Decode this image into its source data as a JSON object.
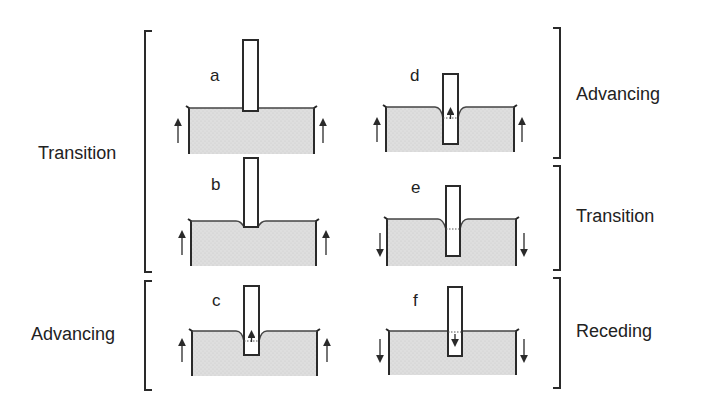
{
  "figure": {
    "colors": {
      "liquid_fill": "#dcdcdc",
      "stroke": "#2a2a2a",
      "background": "#ffffff"
    },
    "left_groups": [
      {
        "label": "Transition",
        "panels": [
          "a",
          "b"
        ]
      },
      {
        "label": "Advancing",
        "panels": [
          "c"
        ]
      }
    ],
    "right_groups": [
      {
        "label": "Advancing",
        "panels": [
          "d"
        ]
      },
      {
        "label": "Transition",
        "panels": [
          "e"
        ]
      },
      {
        "label": "Receding",
        "panels": [
          "f"
        ]
      }
    ],
    "panels": [
      {
        "letter": "a",
        "bath_motion": "up",
        "meniscus": "flat",
        "contact_line_arrow": "none"
      },
      {
        "letter": "b",
        "bath_motion": "up",
        "meniscus": "slight-dip",
        "contact_line_arrow": "none"
      },
      {
        "letter": "c",
        "bath_motion": "up",
        "meniscus": "deep-dip",
        "contact_line_arrow": "up"
      },
      {
        "letter": "d",
        "bath_motion": "up",
        "meniscus": "deep-dip",
        "contact_line_arrow": "up"
      },
      {
        "letter": "e",
        "bath_motion": "down",
        "meniscus": "deep-dip",
        "contact_line_arrow": "none"
      },
      {
        "letter": "f",
        "bath_motion": "down",
        "meniscus": "flat",
        "contact_line_arrow": "down"
      }
    ]
  }
}
